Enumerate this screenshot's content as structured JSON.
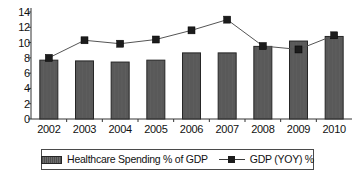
{
  "chart_data": {
    "type": "bar",
    "title": "",
    "subtitle": "",
    "xlabel": "",
    "ylabel": "",
    "categories": [
      "2002",
      "2003",
      "2004",
      "2005",
      "2006",
      "2007",
      "2008",
      "2009",
      "2010"
    ],
    "ylim": [
      0,
      14
    ],
    "y_ticks": [
      0,
      2,
      4,
      6,
      8,
      10,
      12,
      14
    ],
    "y_tick_labels": [
      "0",
      "2",
      "4",
      "6",
      "8",
      "10",
      "12",
      "14"
    ],
    "grid": false,
    "legend_position": "bottom",
    "series": [
      {
        "name": "Healthcare Spending % of GDP",
        "type": "bar",
        "color": "#595959",
        "values": [
          7.7,
          7.6,
          7.45,
          7.7,
          8.65,
          8.65,
          9.5,
          10.2,
          10.8
        ]
      },
      {
        "name": "GDP (YOY) %",
        "type": "line",
        "marker": "square",
        "color": "#1c1c1c",
        "values": [
          8.0,
          10.3,
          9.85,
          10.4,
          11.6,
          13.0,
          9.55,
          9.1,
          10.95
        ]
      }
    ]
  },
  "legend": {
    "entries": [
      {
        "label": "Healthcare Spending % of GDP",
        "swatch": "bar-swatch"
      },
      {
        "label": "GDP (YOY) %",
        "swatch": "line-marker-swatch"
      }
    ]
  }
}
